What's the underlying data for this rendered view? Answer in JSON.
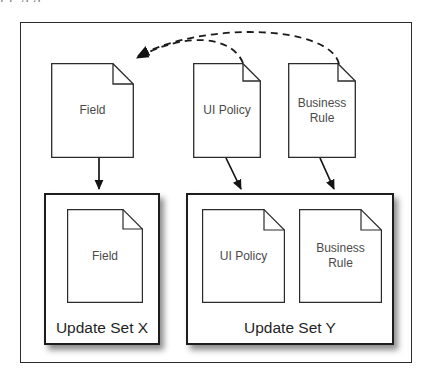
{
  "diagram": {
    "title_remnant": "j  p  g g",
    "top_documents": [
      {
        "id": "field",
        "label": "Field"
      },
      {
        "id": "ui-policy",
        "label": "UI Policy"
      },
      {
        "id": "business-rule",
        "label": "Business\nRule"
      }
    ],
    "containers": [
      {
        "id": "update-set-x",
        "label": "Update Set X",
        "documents": [
          {
            "id": "field",
            "label": "Field"
          }
        ]
      },
      {
        "id": "update-set-y",
        "label": "Update Set Y",
        "documents": [
          {
            "id": "ui-policy",
            "label": "UI Policy"
          },
          {
            "id": "business-rule",
            "label": "Business\nRule"
          }
        ]
      }
    ],
    "connectors": [
      {
        "id": "dashed-ui-policy-to-field",
        "style": "dashed",
        "from": "ui-policy",
        "to": "field"
      },
      {
        "id": "dashed-business-rule-to-field",
        "style": "dashed",
        "from": "business-rule",
        "to": "field"
      },
      {
        "id": "solid-field-to-update-set-x",
        "style": "solid",
        "from": "field",
        "to": "update-set-x"
      },
      {
        "id": "solid-ui-policy-to-update-set-y",
        "style": "solid",
        "from": "ui-policy",
        "to": "update-set-y"
      },
      {
        "id": "solid-business-rule-to-update-set-y",
        "style": "solid",
        "from": "business-rule",
        "to": "update-set-y"
      }
    ],
    "colors": {
      "stroke": "#2b2b2b",
      "container_stroke": "#1d1d1d",
      "text": "#4a4a4a",
      "background": "#ffffff"
    }
  }
}
